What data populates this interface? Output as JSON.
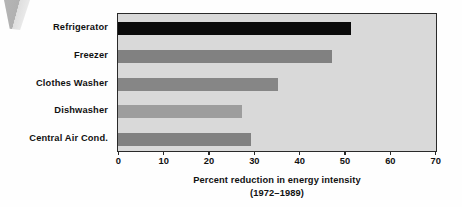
{
  "chart_data": {
    "type": "bar",
    "orientation": "horizontal",
    "title": "",
    "subtitle": "",
    "xlabel": "Percent reduction in energy intensity",
    "xlabel_line2": "(1972–1989)",
    "ylabel": "",
    "categories": [
      "Refrigerator",
      "Freezer",
      "Clothes Washer",
      "Dishwasher",
      "Central Air Cond."
    ],
    "values": [
      51,
      47,
      35,
      27,
      29
    ],
    "xlim": [
      0,
      70
    ],
    "xticks": [
      0,
      10,
      20,
      30,
      40,
      50,
      60,
      70
    ],
    "xtick_labels": [
      "0",
      "10",
      "20",
      "30",
      "40",
      "50",
      "60",
      "70"
    ],
    "grid": false,
    "legend": "none",
    "bar_colors": [
      "#0a0a0a",
      "#818181",
      "#868686",
      "#9d9d9d",
      "#818181"
    ],
    "plot_background": "#d9d9d9",
    "frame_color": "#2a2a2a"
  },
  "caption": {
    "line1": "Percent reduction in energy intensity",
    "line2": "(1972–1989)"
  },
  "artifact": {
    "name": "scan-edge-wedge"
  }
}
